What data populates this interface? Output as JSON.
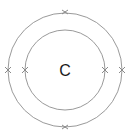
{
  "diagram": {
    "type": "bohr-model",
    "nucleus_label": "C",
    "colors": {
      "shell": "#9a9a9a",
      "electron": "#8a8a8a",
      "text": "#1a1a1a"
    },
    "shells": [
      {
        "name": "inner",
        "electrons": 2
      },
      {
        "name": "outer",
        "electrons": 4
      }
    ]
  }
}
